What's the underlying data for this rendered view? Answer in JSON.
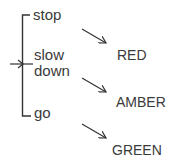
{
  "diagram": {
    "inputs": [
      {
        "label": "stop"
      },
      {
        "label": "slow"
      },
      {
        "label": "down"
      },
      {
        "label": "go"
      }
    ],
    "outputs": [
      {
        "label": "RED"
      },
      {
        "label": "AMBER"
      },
      {
        "label": "GREEN"
      }
    ],
    "colors": {
      "line": "#333333",
      "text": "#3a3a3a",
      "background": "#ffffff"
    }
  }
}
